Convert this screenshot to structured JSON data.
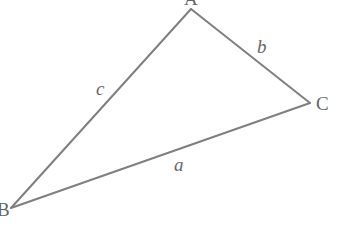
{
  "diagram": {
    "type": "triangle",
    "colors": {
      "line": "#7f7f7f",
      "text": "#666666",
      "background": "#ffffff"
    },
    "vertices": [
      {
        "name": "A",
        "label": "A",
        "x": 191,
        "y": 9
      },
      {
        "name": "B",
        "label": "B",
        "x": 11,
        "y": 208
      },
      {
        "name": "C",
        "label": "C",
        "x": 310,
        "y": 103
      }
    ],
    "sides": [
      {
        "name": "a",
        "label": "a",
        "from": "B",
        "to": "C"
      },
      {
        "name": "b",
        "label": "b",
        "from": "A",
        "to": "C"
      },
      {
        "name": "c",
        "label": "c",
        "from": "A",
        "to": "B"
      }
    ]
  }
}
